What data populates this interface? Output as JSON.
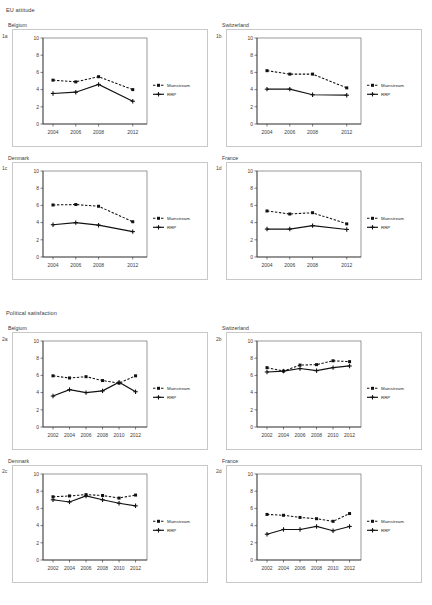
{
  "figure": {
    "sections": [
      {
        "id": "section-eu-attitude",
        "title": "EU attitude",
        "panels": [
          {
            "tag": "1a",
            "country": "Belgium",
            "chart_data": {
              "type": "line",
              "title": "Belgium",
              "xlabel": "",
              "ylabel": "",
              "categories": [
                "2004",
                "2006",
                "2008",
                "2012"
              ],
              "x_positions": [
                0,
                1,
                2,
                3.5
              ],
              "ylim": [
                0,
                10
              ],
              "yticks": [
                0,
                2,
                4,
                6,
                8,
                10
              ],
              "grid": false,
              "legend_position": "right",
              "series": [
                {
                  "name": "Mainstream",
                  "style": "dashed",
                  "marker": "square",
                  "values": [
                    5.1,
                    4.9,
                    5.5,
                    4.0
                  ]
                },
                {
                  "name": "RRP",
                  "style": "solid",
                  "marker": "cross",
                  "values": [
                    3.55,
                    3.7,
                    4.6,
                    2.65
                  ]
                }
              ]
            }
          },
          {
            "tag": "1b",
            "country": "Switzerland",
            "chart_data": {
              "type": "line",
              "title": "Switzerland",
              "xlabel": "",
              "ylabel": "",
              "categories": [
                "2004",
                "2006",
                "2008",
                "2012"
              ],
              "x_positions": [
                0,
                1,
                2,
                3.5
              ],
              "ylim": [
                0,
                10
              ],
              "yticks": [
                0,
                2,
                4,
                6,
                8,
                10
              ],
              "grid": false,
              "legend_position": "right",
              "series": [
                {
                  "name": "Mainstream",
                  "style": "dashed",
                  "marker": "square",
                  "values": [
                    6.2,
                    5.8,
                    5.8,
                    4.2
                  ]
                },
                {
                  "name": "RRP",
                  "style": "solid",
                  "marker": "cross",
                  "values": [
                    4.05,
                    4.05,
                    3.4,
                    3.35
                  ]
                }
              ]
            }
          },
          {
            "tag": "1c",
            "country": "Denmark",
            "chart_data": {
              "type": "line",
              "title": "Denmark",
              "xlabel": "",
              "ylabel": "",
              "categories": [
                "2004",
                "2006",
                "2008",
                "2012"
              ],
              "x_positions": [
                0,
                1,
                2,
                3.5
              ],
              "ylim": [
                0,
                10
              ],
              "yticks": [
                0,
                2,
                4,
                6,
                8,
                10
              ],
              "grid": false,
              "legend_position": "right",
              "series": [
                {
                  "name": "Mainstream",
                  "style": "dashed",
                  "marker": "square",
                  "values": [
                    6.05,
                    6.1,
                    5.9,
                    4.1
                  ]
                },
                {
                  "name": "RRP",
                  "style": "solid",
                  "marker": "cross",
                  "values": [
                    3.75,
                    4.0,
                    3.7,
                    2.95
                  ]
                }
              ]
            }
          },
          {
            "tag": "1d",
            "country": "France",
            "chart_data": {
              "type": "line",
              "title": "France",
              "xlabel": "",
              "ylabel": "",
              "categories": [
                "2004",
                "2006",
                "2008",
                "2012"
              ],
              "x_positions": [
                0,
                1,
                2,
                3.5
              ],
              "ylim": [
                0,
                10
              ],
              "yticks": [
                0,
                2,
                4,
                6,
                8,
                10
              ],
              "grid": false,
              "legend_position": "right",
              "series": [
                {
                  "name": "Mainstream",
                  "style": "dashed",
                  "marker": "square",
                  "values": [
                    5.35,
                    5.0,
                    5.15,
                    3.85
                  ]
                },
                {
                  "name": "RRP",
                  "style": "solid",
                  "marker": "cross",
                  "values": [
                    3.25,
                    3.25,
                    3.65,
                    3.2
                  ]
                }
              ]
            }
          }
        ]
      },
      {
        "id": "section-political-satisfaction",
        "title": "Political satisfaction",
        "panels": [
          {
            "tag": "2a",
            "country": "Belgium",
            "chart_data": {
              "type": "line",
              "title": "Belgium",
              "xlabel": "",
              "ylabel": "",
              "categories": [
                "2002",
                "2004",
                "2006",
                "2008",
                "2010",
                "2012"
              ],
              "x_positions": [
                0,
                1,
                2,
                3,
                4,
                5
              ],
              "ylim": [
                0,
                10
              ],
              "yticks": [
                0,
                2,
                4,
                6,
                8,
                10
              ],
              "grid": false,
              "legend_position": "right",
              "series": [
                {
                  "name": "Mainstream",
                  "style": "dashed",
                  "marker": "square",
                  "values": [
                    5.95,
                    5.7,
                    5.85,
                    5.4,
                    5.1,
                    5.95
                  ]
                },
                {
                  "name": "RRP",
                  "style": "solid",
                  "marker": "cross",
                  "values": [
                    3.6,
                    4.35,
                    4.0,
                    4.2,
                    5.2,
                    4.1
                  ]
                }
              ]
            }
          },
          {
            "tag": "2b",
            "country": "Switzerland",
            "chart_data": {
              "type": "line",
              "title": "Switzerland",
              "xlabel": "",
              "ylabel": "",
              "categories": [
                "2002",
                "2004",
                "2006",
                "2008",
                "2010",
                "2012"
              ],
              "x_positions": [
                0,
                1,
                2,
                3,
                4,
                5
              ],
              "ylim": [
                0,
                10
              ],
              "yticks": [
                0,
                2,
                4,
                6,
                8,
                10
              ],
              "grid": false,
              "legend_position": "right",
              "series": [
                {
                  "name": "Mainstream",
                  "style": "dashed",
                  "marker": "square",
                  "values": [
                    6.9,
                    6.5,
                    7.2,
                    7.25,
                    7.7,
                    7.6
                  ]
                },
                {
                  "name": "RRP",
                  "style": "solid",
                  "marker": "cross",
                  "values": [
                    6.4,
                    6.5,
                    6.8,
                    6.55,
                    6.9,
                    7.1
                  ]
                }
              ]
            }
          },
          {
            "tag": "2c",
            "country": "Denmark",
            "chart_data": {
              "type": "line",
              "title": "Denmark",
              "xlabel": "",
              "ylabel": "",
              "categories": [
                "2002",
                "2004",
                "2006",
                "2008",
                "2010",
                "2012"
              ],
              "x_positions": [
                0,
                1,
                2,
                3,
                4,
                5
              ],
              "ylim": [
                0,
                10
              ],
              "yticks": [
                0,
                2,
                4,
                6,
                8,
                10
              ],
              "grid": false,
              "legend_position": "right",
              "series": [
                {
                  "name": "Mainstream",
                  "style": "dashed",
                  "marker": "square",
                  "values": [
                    7.35,
                    7.45,
                    7.6,
                    7.5,
                    7.2,
                    7.55
                  ]
                },
                {
                  "name": "RRP",
                  "style": "solid",
                  "marker": "cross",
                  "values": [
                    7.0,
                    6.75,
                    7.45,
                    7.0,
                    6.6,
                    6.3
                  ]
                }
              ]
            }
          },
          {
            "tag": "2d",
            "country": "France",
            "chart_data": {
              "type": "line",
              "title": "France",
              "xlabel": "",
              "ylabel": "",
              "categories": [
                "2002",
                "2004",
                "2006",
                "2008",
                "2010",
                "2012"
              ],
              "x_positions": [
                0,
                1,
                2,
                3,
                4,
                5
              ],
              "ylim": [
                0,
                10
              ],
              "yticks": [
                0,
                2,
                4,
                6,
                8,
                10
              ],
              "grid": false,
              "legend_position": "right",
              "series": [
                {
                  "name": "Mainstream",
                  "style": "dashed",
                  "marker": "square",
                  "values": [
                    5.3,
                    5.2,
                    4.95,
                    4.8,
                    4.5,
                    5.4
                  ]
                },
                {
                  "name": "RRP",
                  "style": "solid",
                  "marker": "cross",
                  "values": [
                    3.0,
                    3.55,
                    3.55,
                    3.9,
                    3.4,
                    3.9
                  ]
                }
              ]
            }
          }
        ]
      }
    ]
  }
}
